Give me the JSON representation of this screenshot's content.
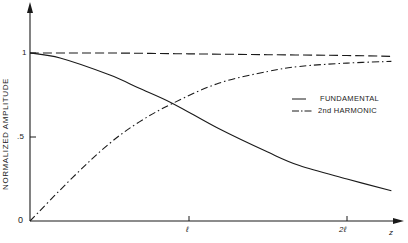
{
  "chart_data": {
    "type": "line",
    "title": "",
    "xlabel": "z",
    "ylabel": "NORMALIZED AMPLITUDE",
    "x_ticks": [
      {
        "value": 1,
        "label": "ℓ"
      },
      {
        "value": 2,
        "label": "2ℓ"
      }
    ],
    "y_ticks": [
      {
        "value": 0,
        "label": "0"
      },
      {
        "value": 0.5,
        "label": ".5"
      },
      {
        "value": 1,
        "label": "1"
      }
    ],
    "xlim": [
      0,
      2.35
    ],
    "ylim": [
      0,
      1.25
    ],
    "grid": false,
    "legend_position": "right-center",
    "series": [
      {
        "name": "FUNDAMENTAL",
        "style": "solid",
        "x": [
          0,
          0.19,
          0.5,
          0.69,
          0.9,
          1.19,
          1.5,
          1.7,
          2.0,
          2.28
        ],
        "values": [
          1.0,
          0.97,
          0.87,
          0.79,
          0.7,
          0.55,
          0.41,
          0.33,
          0.25,
          0.18
        ]
      },
      {
        "name": "2nd HARMONIC",
        "style": "dash-dot",
        "x": [
          0,
          0.27,
          0.5,
          0.69,
          0.9,
          1.19,
          1.5,
          1.7,
          2.0,
          2.28
        ],
        "values": [
          0.0,
          0.26,
          0.46,
          0.59,
          0.7,
          0.82,
          0.89,
          0.92,
          0.94,
          0.95
        ]
      },
      {
        "name": "TOTAL (unlabeled dashed)",
        "style": "dashed",
        "x": [
          0,
          0.5,
          1.0,
          1.5,
          2.0,
          2.28
        ],
        "values": [
          1.0,
          1.0,
          0.995,
          0.99,
          0.985,
          0.98
        ]
      }
    ],
    "annotations": []
  },
  "axes": {
    "y_label": "NORMALIZED  AMPLITUDE",
    "x_label": "z",
    "y_tick_1": "1",
    "y_tick_half": ".5",
    "y_tick_0": "0",
    "x_tick_l": "ℓ",
    "x_tick_2l": "2ℓ"
  },
  "legend": {
    "fundamental": "FUNDAMENTAL",
    "harmonic": "2nd  HARMONIC"
  },
  "colors": {
    "ink": "#1a1a1a",
    "background": "#ffffff"
  }
}
